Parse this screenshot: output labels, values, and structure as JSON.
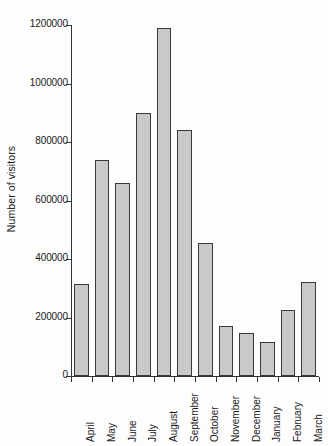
{
  "chart_data": {
    "type": "bar",
    "title": "",
    "xlabel": "",
    "ylabel": "Number of visitors",
    "categories": [
      "April",
      "May",
      "June",
      "July",
      "August",
      "September",
      "October",
      "November",
      "December",
      "January",
      "February",
      "March"
    ],
    "values": [
      315000,
      740000,
      660000,
      900000,
      1190000,
      840000,
      455000,
      172000,
      148000,
      118000,
      225000,
      322000
    ],
    "ylim": [
      0,
      1200000
    ],
    "ytick_values": [
      0,
      200000,
      400000,
      600000,
      800000,
      1000000,
      1200000
    ],
    "ytick_labels": [
      "0",
      "200000",
      "400000",
      "600000",
      "800000",
      "1000000",
      "1200000"
    ],
    "grid": false,
    "legend": false,
    "bar_color": "#c9c9c9",
    "bar_edge_color": "#3a3a3a",
    "axis_color": "#333333",
    "background_color": "#fdfdfd"
  }
}
